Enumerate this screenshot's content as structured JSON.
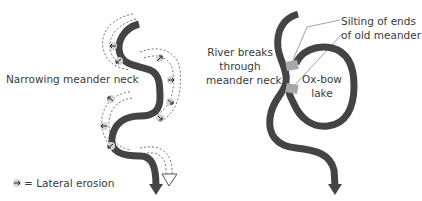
{
  "figure": {
    "left_panel": {
      "title": "Narrowing meander neck",
      "legend_label": "= Lateral erosion",
      "legend_icon": "lateral-erosion-arrow-icon"
    },
    "right_panel": {
      "label_break_line1": "River breaks",
      "label_break_line2": "through",
      "label_break_line3": "meander neck",
      "label_silting_line1": "Silting of ends",
      "label_silting_line2": "of old meander",
      "label_oxbow_line1": "Ox-bow",
      "label_oxbow_line2": "lake"
    },
    "colors": {
      "river": "#444444",
      "silt": "#a8a8a8",
      "dashed": "#666666",
      "text": "#3a3a3a"
    }
  }
}
